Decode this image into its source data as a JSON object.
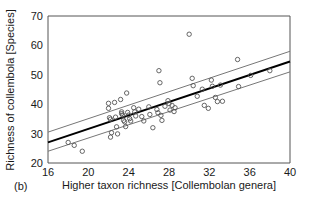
{
  "panel": {
    "label": "(b)"
  },
  "chart_data": {
    "type": "scatter",
    "title": "",
    "xlabel": "Higher taxon richness [Collembolan genera]",
    "ylabel": "Richness of collembola [Species]",
    "xlim": [
      16,
      40
    ],
    "ylim": [
      20,
      70
    ],
    "xticks": [
      16,
      20,
      24,
      28,
      32,
      36,
      40
    ],
    "yticks": [
      20,
      30,
      40,
      50,
      60,
      70
    ],
    "xtick_labels": [
      "16",
      "20",
      "24",
      "28",
      "32",
      "36",
      "40"
    ],
    "ytick_labels": [
      "20",
      "30",
      "40",
      "50",
      "60",
      "70"
    ],
    "grid": false,
    "legend": null,
    "marker": "open-circle",
    "marker_color": "#555555",
    "points": [
      [
        18.0,
        27.0
      ],
      [
        18.6,
        26.0
      ],
      [
        19.4,
        24.0
      ],
      [
        22.0,
        40.3
      ],
      [
        22.0,
        38.6
      ],
      [
        22.1,
        35.4
      ],
      [
        22.2,
        34.9
      ],
      [
        22.3,
        30.3
      ],
      [
        22.2,
        28.8
      ],
      [
        22.6,
        40.6
      ],
      [
        22.7,
        35.6
      ],
      [
        22.8,
        32.3
      ],
      [
        22.9,
        29.9
      ],
      [
        23.2,
        41.6
      ],
      [
        23.3,
        37.4
      ],
      [
        23.3,
        36.8
      ],
      [
        23.4,
        36.3
      ],
      [
        23.5,
        34.5
      ],
      [
        23.6,
        34.0
      ],
      [
        23.7,
        32.4
      ],
      [
        23.8,
        43.8
      ],
      [
        23.9,
        37.2
      ],
      [
        24.0,
        36.3
      ],
      [
        24.1,
        35.1
      ],
      [
        24.2,
        34.3
      ],
      [
        24.5,
        38.8
      ],
      [
        24.6,
        37.4
      ],
      [
        24.7,
        36.0
      ],
      [
        25.0,
        38.3
      ],
      [
        25.3,
        35.8
      ],
      [
        25.5,
        34.3
      ],
      [
        26.0,
        39.1
      ],
      [
        26.1,
        36.5
      ],
      [
        26.4,
        32.0
      ],
      [
        26.8,
        38.2
      ],
      [
        26.9,
        37.1
      ],
      [
        27.0,
        51.4
      ],
      [
        27.1,
        47.3
      ],
      [
        27.2,
        36.2
      ],
      [
        27.3,
        34.5
      ],
      [
        27.6,
        39.3
      ],
      [
        27.9,
        41.2
      ],
      [
        28.0,
        40.2
      ],
      [
        28.1,
        38.0
      ],
      [
        28.3,
        39.6
      ],
      [
        28.5,
        37.5
      ],
      [
        28.6,
        38.8
      ],
      [
        30.0,
        63.8
      ],
      [
        30.3,
        48.8
      ],
      [
        30.4,
        46.3
      ],
      [
        30.8,
        42.7
      ],
      [
        31.3,
        45.1
      ],
      [
        31.5,
        39.6
      ],
      [
        31.9,
        38.6
      ],
      [
        32.2,
        48.2
      ],
      [
        32.3,
        46.1
      ],
      [
        32.6,
        42.3
      ],
      [
        32.8,
        40.9
      ],
      [
        33.1,
        46.5
      ],
      [
        33.3,
        41.0
      ],
      [
        34.8,
        55.2
      ],
      [
        34.9,
        46.0
      ],
      [
        36.1,
        49.8
      ],
      [
        38.0,
        51.4
      ]
    ],
    "fit_line": {
      "name": "regression-line",
      "color": "#000000",
      "x": [
        16,
        40
      ],
      "y": [
        27.0,
        54.5
      ]
    },
    "confidence_bands": [
      {
        "name": "upper-confidence-band",
        "color": "#777777",
        "x": [
          16,
          40
        ],
        "y": [
          30.5,
          58.0
        ]
      },
      {
        "name": "lower-confidence-band",
        "color": "#777777",
        "x": [
          16,
          40
        ],
        "y": [
          24.0,
          51.0
        ]
      }
    ]
  }
}
